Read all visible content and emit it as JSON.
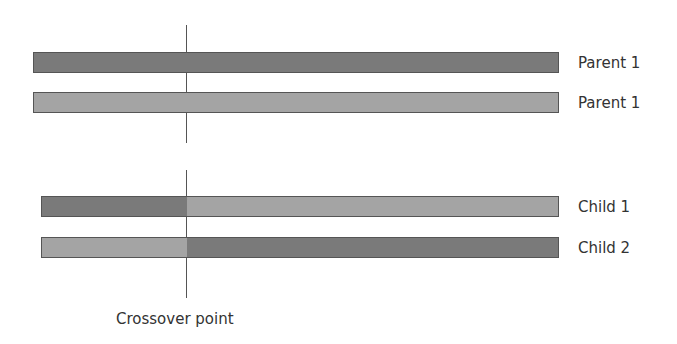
{
  "colors": {
    "dark": "#7a7a7a",
    "light": "#a4a4a4",
    "line": "#555555",
    "text": "#333333"
  },
  "rows": [
    {
      "label": "Parent 1",
      "type": "parent",
      "segments": [
        "dark"
      ]
    },
    {
      "label": "Parent 1",
      "type": "parent",
      "segments": [
        "light"
      ]
    },
    {
      "label": "Child 1",
      "type": "child",
      "segments": [
        "dark",
        "light"
      ]
    },
    {
      "label": "Child 2",
      "type": "child",
      "segments": [
        "light",
        "dark"
      ]
    }
  ],
  "crossover": {
    "label": "Crossover point"
  }
}
